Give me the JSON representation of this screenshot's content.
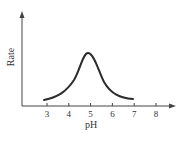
{
  "chart_data": {
    "type": "line",
    "title": "",
    "xlabel": "pH",
    "ylabel": "Rate",
    "x_ticks": [
      "3",
      "4",
      "5",
      "6",
      "7",
      "8"
    ],
    "xlim": [
      1.8,
      8.9
    ],
    "y_ticks": [],
    "grid": false,
    "legend": null,
    "series": [
      {
        "name": "Enzyme rate vs pH",
        "x": [
          2.9,
          3.5,
          4.0,
          4.4,
          4.7,
          4.9,
          5.1,
          5.4,
          5.8,
          6.3,
          6.9
        ],
        "y": [
          0.05,
          0.12,
          0.25,
          0.5,
          0.82,
          0.92,
          0.85,
          0.55,
          0.25,
          0.1,
          0.05
        ]
      }
    ],
    "annotations": []
  },
  "colors": {
    "axis": "#444444",
    "curve": "#2b2b2b",
    "text": "#333333",
    "background": "#ffffff"
  }
}
